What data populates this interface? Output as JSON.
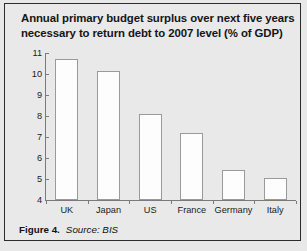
{
  "chart_data": {
    "type": "bar",
    "title": "Annual primary budget surplus over next five years necessary to return debt to 2007 level (% of GDP)",
    "title_line1": "Annual primary budget surplus over next five years",
    "title_line2": "necessary to return debt to 2007 level (% of GDP)",
    "categories": [
      "UK",
      "Japan",
      "US",
      "France",
      "Germany",
      "Italy"
    ],
    "values": [
      10.7,
      10.15,
      8.1,
      7.2,
      5.45,
      5.05
    ],
    "xlabel": "",
    "ylabel": "",
    "ylim": [
      4,
      11
    ],
    "yticks": [
      11,
      10,
      9,
      8,
      7,
      6,
      5,
      4
    ],
    "ytick_labels": [
      "11",
      "10",
      "9",
      "8",
      "7",
      "6",
      "5",
      "4"
    ],
    "grid": false,
    "legend": false,
    "bar_fill": "#fdfdfd",
    "bar_edge": "#9a9a9a",
    "background": "#e9e9e9"
  },
  "caption": {
    "figure_label": "Figure 4.",
    "source_prefix": "Source:",
    "source_name": "BIS"
  }
}
